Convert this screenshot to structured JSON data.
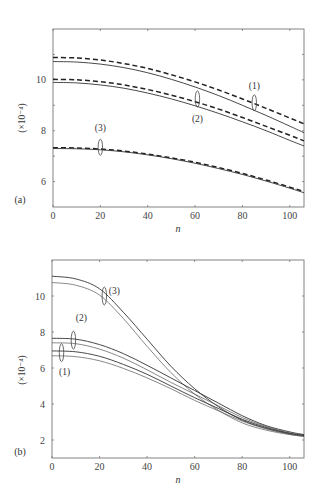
{
  "chart_data": [
    {
      "type": "line",
      "panel_label": "(a)",
      "title": "",
      "xlabel": "n",
      "ylabel": "(×10⁻⁴)",
      "xlim": [
        0,
        106
      ],
      "ylim": [
        5,
        12
      ],
      "xticks": [
        0,
        20,
        40,
        60,
        80,
        100
      ],
      "xtick_labels": [
        "0",
        "20",
        "40",
        "60",
        "80",
        "100"
      ],
      "yticks": [
        6,
        8,
        10
      ],
      "ytick_labels": [
        "6",
        "8",
        "10"
      ],
      "minor_yticks": [
        7,
        9,
        11
      ],
      "grid": false,
      "x": [
        0,
        10,
        20,
        30,
        40,
        50,
        60,
        70,
        80,
        90,
        100,
        106
      ],
      "series": [
        {
          "name": "(1) dashed",
          "group": "(1)",
          "style": "dashed",
          "values": [
            10.88,
            10.86,
            10.78,
            10.64,
            10.45,
            10.2,
            9.92,
            9.6,
            9.25,
            8.88,
            8.5,
            8.27
          ]
        },
        {
          "name": "(1) solid",
          "group": "(1)",
          "style": "solid",
          "values": [
            10.72,
            10.7,
            10.62,
            10.48,
            10.28,
            10.02,
            9.72,
            9.38,
            9.0,
            8.6,
            8.18,
            7.92
          ]
        },
        {
          "name": "(2) dashed",
          "group": "(2)",
          "style": "dashed",
          "values": [
            10.02,
            10.0,
            9.93,
            9.8,
            9.62,
            9.4,
            9.14,
            8.85,
            8.52,
            8.17,
            7.82,
            7.6
          ]
        },
        {
          "name": "(2) solid",
          "group": "(2)",
          "style": "solid",
          "values": [
            9.9,
            9.88,
            9.8,
            9.67,
            9.48,
            9.25,
            8.98,
            8.68,
            8.35,
            8.0,
            7.62,
            7.4
          ]
        },
        {
          "name": "(3) dashed",
          "group": "(3)",
          "style": "dashed",
          "values": [
            7.33,
            7.32,
            7.28,
            7.2,
            7.08,
            6.93,
            6.76,
            6.55,
            6.32,
            6.06,
            5.78,
            5.6
          ]
        },
        {
          "name": "(3) solid",
          "group": "(3)",
          "style": "solid",
          "values": [
            7.3,
            7.29,
            7.25,
            7.17,
            7.05,
            6.9,
            6.72,
            6.51,
            6.28,
            6.02,
            5.74,
            5.56
          ]
        }
      ],
      "annotations": [
        {
          "label": "(1)",
          "at_x": 85,
          "at_y": 9.1
        },
        {
          "label": "(2)",
          "at_x": 61,
          "at_y": 9.25
        },
        {
          "label": "(3)",
          "at_x": 20,
          "at_y": 7.35
        }
      ]
    },
    {
      "type": "line",
      "panel_label": "(b)",
      "title": "",
      "xlabel": "n",
      "ylabel": "(×10⁻⁴)",
      "xlim": [
        0,
        106
      ],
      "ylim": [
        1,
        12
      ],
      "xticks": [
        0,
        20,
        40,
        60,
        80,
        100
      ],
      "xtick_labels": [
        "0",
        "20",
        "40",
        "60",
        "80",
        "100"
      ],
      "yticks": [
        2,
        4,
        6,
        8,
        10
      ],
      "ytick_labels": [
        "2",
        "4",
        "6",
        "8",
        "10"
      ],
      "minor_yticks": [],
      "grid": false,
      "x": [
        0,
        10,
        20,
        30,
        40,
        50,
        60,
        70,
        80,
        90,
        100,
        106
      ],
      "series": [
        {
          "name": "(3) upper",
          "group": "(3)",
          "style": "solid",
          "values": [
            11.1,
            10.95,
            10.4,
            9.1,
            7.6,
            6.1,
            4.85,
            3.85,
            3.1,
            2.65,
            2.35,
            2.25
          ]
        },
        {
          "name": "(3) lower",
          "group": "(3)",
          "style": "solid-thin",
          "values": [
            10.75,
            10.6,
            10.05,
            8.75,
            7.2,
            5.75,
            4.55,
            3.65,
            2.95,
            2.55,
            2.3,
            2.2
          ]
        },
        {
          "name": "(2) upper",
          "group": "(2)",
          "style": "solid",
          "values": [
            7.65,
            7.6,
            7.3,
            6.8,
            6.15,
            5.45,
            4.75,
            4.05,
            3.35,
            2.8,
            2.45,
            2.3
          ]
        },
        {
          "name": "(2) lower",
          "group": "(2)",
          "style": "solid-thin",
          "values": [
            7.4,
            7.35,
            7.05,
            6.55,
            5.9,
            5.2,
            4.55,
            3.9,
            3.25,
            2.75,
            2.4,
            2.27
          ]
        },
        {
          "name": "(1) upper",
          "group": "(1)",
          "style": "solid",
          "values": [
            6.95,
            6.9,
            6.65,
            6.2,
            5.65,
            5.0,
            4.35,
            3.75,
            3.15,
            2.7,
            2.37,
            2.25
          ]
        },
        {
          "name": "(1) lower",
          "group": "(1)",
          "style": "solid-thin",
          "values": [
            6.68,
            6.63,
            6.4,
            5.98,
            5.45,
            4.85,
            4.2,
            3.62,
            3.05,
            2.62,
            2.32,
            2.2
          ]
        }
      ],
      "annotations": [
        {
          "label": "(1)",
          "at_x": 4,
          "at_y": 6.85
        },
        {
          "label": "(2)",
          "at_x": 9,
          "at_y": 7.55
        },
        {
          "label": "(3)",
          "at_x": 22,
          "at_y": 10.0
        }
      ]
    }
  ]
}
